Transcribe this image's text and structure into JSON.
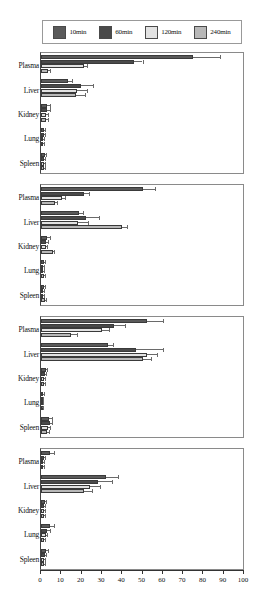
{
  "legend": {
    "items": [
      {
        "label": "10min",
        "color": "#5a5a5a"
      },
      {
        "label": "60min",
        "color": "#4a4a4a"
      },
      {
        "label": "120min",
        "color": "#e2e2e2"
      },
      {
        "label": "240min",
        "color": "#b8b8b8"
      }
    ]
  },
  "axis": {
    "ticks": [
      "0",
      "10",
      "20",
      "30",
      "40",
      "50",
      "60",
      "70",
      "80",
      "90",
      "100"
    ]
  },
  "chart_data": {
    "type": "bar",
    "title": "",
    "xlabel": "",
    "ylabel": "",
    "xlim": [
      0,
      100
    ],
    "grid": false,
    "legend_position": "top",
    "orientation": "horizontal",
    "categories": [
      "Plasma",
      "Liver",
      "Kidney",
      "Lung",
      "Spleen"
    ],
    "series_names": [
      "10min",
      "60min",
      "120min",
      "240min"
    ],
    "panels": [
      {
        "name": "panel-1",
        "groups": [
          {
            "category": "Plasma",
            "values": [
              75.0,
              46.0,
              21.0,
              3.5
            ],
            "errors": [
              13.0,
              4.0,
              1.5,
              0.8
            ]
          },
          {
            "category": "Liver",
            "values": [
              13.5,
              19.5,
              17.5,
              17.0
            ],
            "errors": [
              2.0,
              6.0,
              5.0,
              4.5
            ]
          },
          {
            "category": "Kidney",
            "values": [
              3.0,
              3.2,
              2.6,
              2.4
            ],
            "errors": [
              1.6,
              1.2,
              1.0,
              0.9
            ]
          },
          {
            "category": "Lung",
            "values": [
              1.6,
              1.4,
              1.2,
              1.0
            ],
            "errors": [
              0.5,
              0.4,
              0.4,
              0.3
            ]
          },
          {
            "category": "Spleen",
            "values": [
              1.8,
              1.6,
              1.4,
              1.3
            ],
            "errors": [
              0.6,
              0.5,
              0.5,
              0.5
            ]
          }
        ]
      },
      {
        "name": "panel-2",
        "groups": [
          {
            "category": "Plasma",
            "values": [
              50.0,
              21.0,
              10.5,
              7.0
            ],
            "errors": [
              6.0,
              2.5,
              1.5,
              1.0
            ]
          },
          {
            "category": "Liver",
            "values": [
              18.5,
              22.0,
              18.0,
              40.0
            ],
            "errors": [
              2.0,
              6.5,
              5.0,
              2.5
            ]
          },
          {
            "category": "Kidney",
            "values": [
              3.0,
              2.6,
              2.4,
              6.0
            ],
            "errors": [
              1.2,
              0.9,
              0.8,
              0.6
            ]
          },
          {
            "category": "Lung",
            "values": [
              1.5,
              1.2,
              1.0,
              1.6
            ],
            "errors": [
              0.4,
              0.4,
              0.3,
              0.4
            ]
          },
          {
            "category": "Spleen",
            "values": [
              1.4,
              1.2,
              1.1,
              2.0
            ],
            "errors": [
              0.4,
              0.4,
              0.3,
              0.5
            ]
          }
        ]
      },
      {
        "name": "panel-3",
        "groups": [
          {
            "category": "Plasma",
            "values": [
              52.0,
              36.0,
              30.0,
              15.0
            ],
            "errors": [
              8.0,
              5.5,
              3.5,
              2.5
            ]
          },
          {
            "category": "Liver",
            "values": [
              33.0,
              47.0,
              52.0,
              50.0
            ],
            "errors": [
              2.5,
              13.0,
              5.0,
              4.0
            ]
          },
          {
            "category": "Kidney",
            "values": [
              2.4,
              2.0,
              1.6,
              1.4
            ],
            "errors": [
              0.8,
              0.7,
              0.5,
              0.5
            ]
          },
          {
            "category": "Lung",
            "values": [
              1.0,
              0.9,
              0.8,
              0.7
            ],
            "errors": [
              0.3,
              0.3,
              0.3,
              0.2
            ]
          },
          {
            "category": "Spleen",
            "values": [
              4.0,
              4.2,
              3.4,
              3.0
            ],
            "errors": [
              1.6,
              1.2,
              1.0,
              0.9
            ]
          }
        ]
      },
      {
        "name": "panel-4",
        "groups": [
          {
            "category": "Plasma",
            "values": [
              4.5,
              1.6,
              1.2,
              1.0
            ],
            "errors": [
              2.0,
              0.5,
              0.4,
              0.3
            ]
          },
          {
            "category": "Liver",
            "values": [
              32.0,
              28.0,
              24.0,
              21.0
            ],
            "errors": [
              6.0,
              7.0,
              5.0,
              4.0
            ]
          },
          {
            "category": "Kidney",
            "values": [
              1.8,
              1.6,
              1.6,
              1.4
            ],
            "errors": [
              0.6,
              0.5,
              0.5,
              0.4
            ]
          },
          {
            "category": "Lung",
            "values": [
              4.5,
              3.0,
              2.4,
              1.4
            ],
            "errors": [
              2.0,
              1.2,
              0.8,
              0.4
            ]
          },
          {
            "category": "Spleen",
            "values": [
              2.4,
              2.0,
              1.6,
              1.4
            ],
            "errors": [
              0.9,
              0.7,
              0.5,
              0.4
            ]
          }
        ]
      }
    ]
  }
}
